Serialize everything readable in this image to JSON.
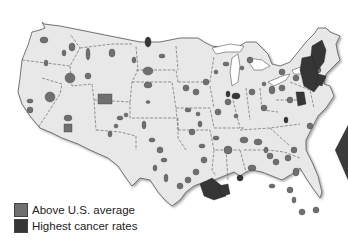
{
  "map": {
    "subject": "U.S. cancer rates by county area",
    "land_color": "#e8e8e8",
    "border_color": "#555555",
    "above_color": "#6f6f6f",
    "highest_color": "#363636"
  },
  "legend": {
    "items": [
      {
        "label": "Above U.S. average",
        "color": "#6f6f6f"
      },
      {
        "label": "Highest cancer rates",
        "color": "#363636"
      }
    ]
  }
}
